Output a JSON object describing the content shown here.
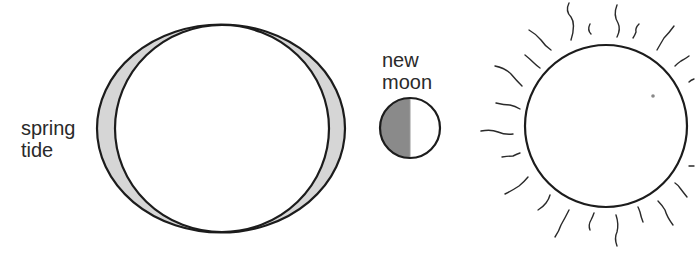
{
  "labels": {
    "tide": [
      "spring",
      "tide"
    ],
    "moon": [
      "new",
      "moon"
    ]
  },
  "colors": {
    "stroke": "#1c1c1c",
    "tidal_bulge_fill": "#d6d6d6",
    "moon_shadow_fill": "#8a8a8a",
    "background": "#ffffff"
  }
}
